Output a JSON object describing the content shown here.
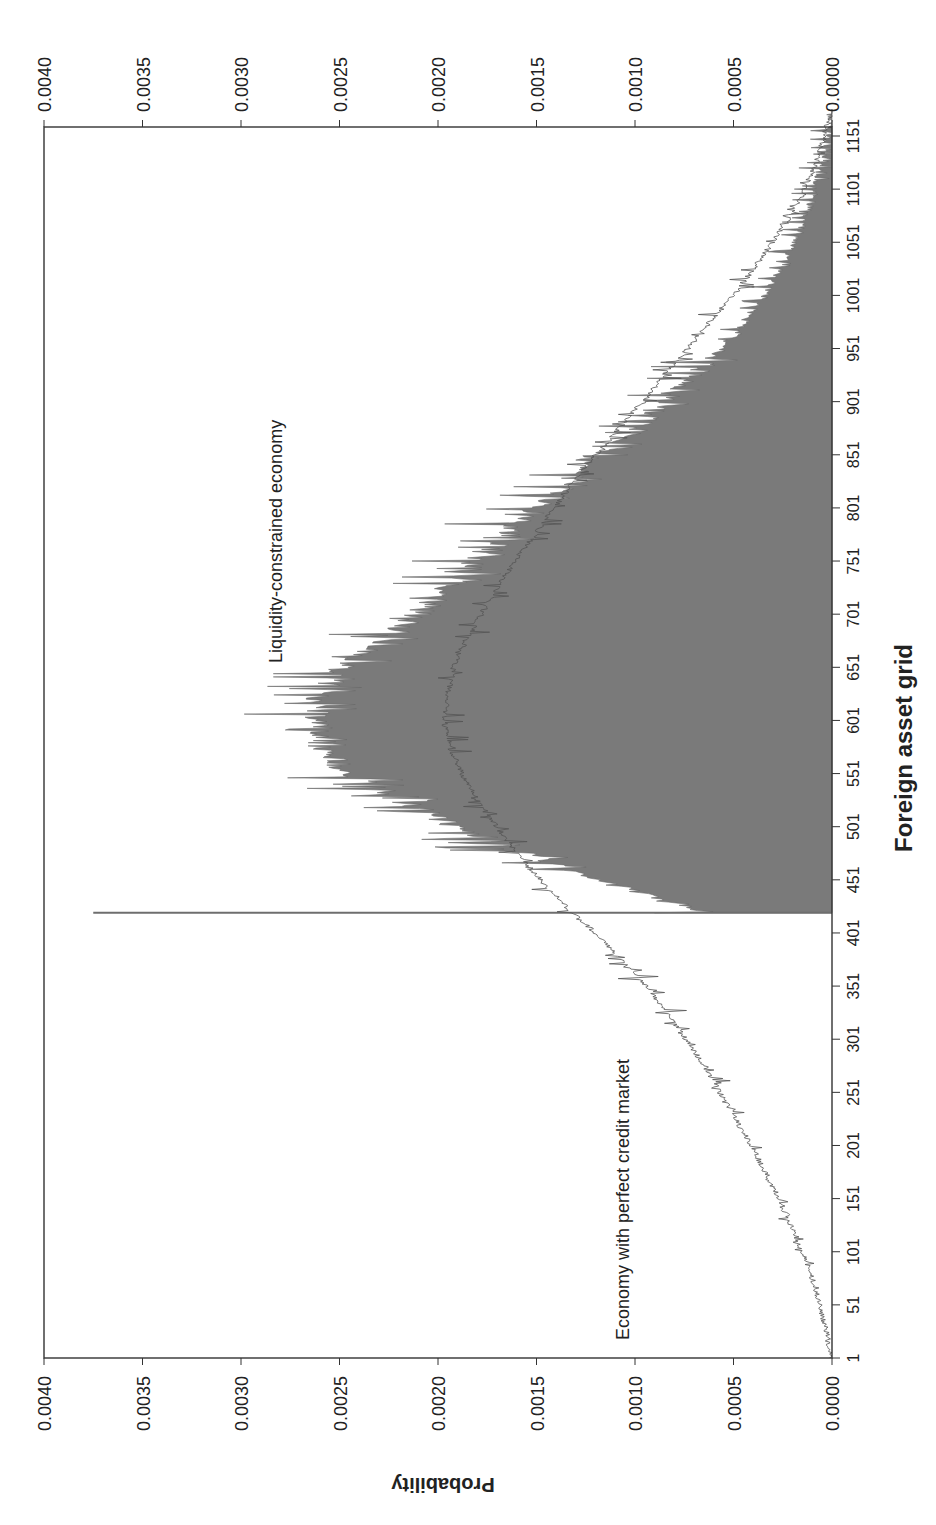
{
  "chart_data": {
    "type": "area",
    "orientation": "rotated-90-ccw",
    "title": "",
    "xlabel": "Foreign asset grid",
    "ylabel": "Probability",
    "ylim": [
      0,
      0.004
    ],
    "xlim": [
      1,
      1181
    ],
    "y_ticks": [
      "0.0000",
      "0.0005",
      "0.0010",
      "0.0015",
      "0.0020",
      "0.0025",
      "0.0030",
      "0.0035",
      "0.0040"
    ],
    "x_ticks": [
      "1",
      "51",
      "101",
      "151",
      "201",
      "251",
      "301",
      "351",
      "401",
      "451",
      "501",
      "551",
      "601",
      "651",
      "701",
      "751",
      "801",
      "851",
      "901",
      "951",
      "1001",
      "1051",
      "1101",
      "1151"
    ],
    "grid": false,
    "legend": "none (inline annotations)",
    "annotations": [
      {
        "text": "Liquidity-constrained economy",
        "x": 701,
        "y": 0.0027
      },
      {
        "text": "Economy with perfect credit market",
        "x": 30,
        "y": 0.00102
      }
    ],
    "series": [
      {
        "name": "Liquidity-constrained economy",
        "style": "filled area (dark gray), noisy",
        "color": "#7a7a7a",
        "x": [
          419,
          420,
          430,
          451,
          476,
          501,
          526,
          551,
          576,
          601,
          626,
          651,
          676,
          701,
          726,
          751,
          776,
          801,
          826,
          851,
          876,
          901,
          926,
          951,
          976,
          1001,
          1026,
          1051,
          1076,
          1101,
          1126,
          1151,
          1176
        ],
        "values": [
          0.00375,
          0.00065,
          0.0008,
          0.0012,
          0.00155,
          0.0019,
          0.0022,
          0.00245,
          0.0026,
          0.00262,
          0.0026,
          0.00248,
          0.0023,
          0.0021,
          0.00195,
          0.0018,
          0.00165,
          0.0015,
          0.00132,
          0.00118,
          0.00098,
          0.00085,
          0.0007,
          0.00055,
          0.00044,
          0.00034,
          0.00026,
          0.00019,
          0.00013,
          9e-05,
          5e-05,
          2e-05,
          0.0
        ]
      },
      {
        "name": "Economy with perfect credit market",
        "style": "thin line, noisy",
        "color": "#555555",
        "x": [
          1,
          26,
          51,
          76,
          101,
          126,
          151,
          176,
          201,
          226,
          251,
          276,
          301,
          326,
          351,
          376,
          401,
          426,
          451,
          476,
          501,
          526,
          551,
          576,
          601,
          626,
          651,
          676,
          701,
          726,
          751,
          776,
          801,
          826,
          851,
          876,
          901,
          926,
          951,
          976,
          1001,
          1026,
          1051,
          1076,
          1101,
          1126,
          1151,
          1176
        ],
        "values": [
          0.0,
          3e-05,
          6e-05,
          0.0001,
          0.00015,
          0.00021,
          0.00027,
          0.00034,
          0.00041,
          0.00049,
          0.00057,
          0.00065,
          0.00074,
          0.00084,
          0.00094,
          0.00107,
          0.0012,
          0.00135,
          0.00148,
          0.0016,
          0.0017,
          0.0018,
          0.00188,
          0.00194,
          0.00197,
          0.00195,
          0.00192,
          0.00186,
          0.00178,
          0.0017,
          0.00161,
          0.00151,
          0.00141,
          0.00131,
          0.0012,
          0.00108,
          0.00096,
          0.00085,
          0.00073,
          0.00062,
          0.0005,
          0.0004,
          0.0003,
          0.00021,
          0.00014,
          8e-05,
          4e-05,
          0.0
        ]
      }
    ]
  }
}
